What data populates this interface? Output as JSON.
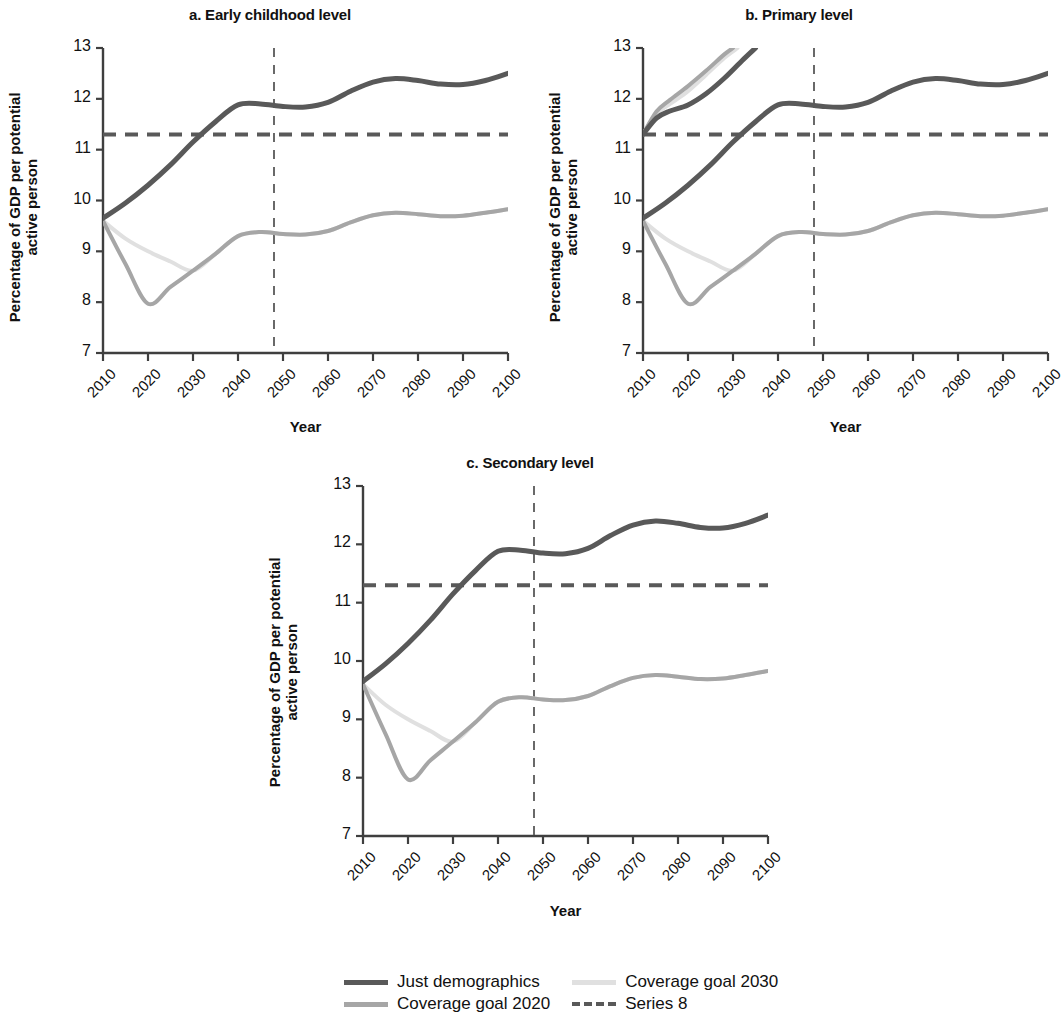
{
  "figure": {
    "background": "#ffffff",
    "panels": [
      {
        "id": "a",
        "title": "a. Early childhood level",
        "xlabel": "Year",
        "ylabel_line1": "Percentage of GDP per potential",
        "ylabel_line2": "active person"
      },
      {
        "id": "b",
        "title": "b. Primary level",
        "xlabel": "Year",
        "ylabel_line1": "Percentage of GDP per potential",
        "ylabel_line2": "active person"
      },
      {
        "id": "c",
        "title": "c. Secondary level",
        "xlabel": "Year",
        "ylabel_line1": "Percentage of GDP per potential",
        "ylabel_line2": "active person"
      }
    ]
  },
  "colors": {
    "just_demographics": "#595959",
    "coverage_goal_2020": "#a6a6a6",
    "coverage_goal_2030": "#e0e0e0",
    "series_8": "#595959",
    "axis": "#3f3f3f",
    "text": "#111111"
  },
  "legend": {
    "position": "bottom-center",
    "items": [
      {
        "label": "Just demographics",
        "color": "#595959",
        "style": "solid"
      },
      {
        "label": "Coverage goal 2030",
        "color": "#e0e0e0",
        "style": "solid"
      },
      {
        "label": "Coverage goal 2020",
        "color": "#a6a6a6",
        "style": "solid"
      },
      {
        "label": "Series 8",
        "color": "#595959",
        "style": "dashed"
      }
    ]
  },
  "chart_data": [
    {
      "type": "line",
      "panel": "a",
      "title": "a. Early childhood level",
      "xlabel": "Year",
      "ylabel": "Percentage of GDP per potential active person",
      "xlim": [
        2010,
        2100
      ],
      "ylim": [
        7,
        13
      ],
      "xticks": [
        2010,
        2020,
        2030,
        2040,
        2050,
        2060,
        2070,
        2080,
        2090,
        2100
      ],
      "yticks": [
        7,
        8,
        9,
        10,
        11,
        12,
        13
      ],
      "grid": false,
      "legend_position": "below figure",
      "annotations": [
        {
          "kind": "hline",
          "name": "Series 8",
          "y": 11.3,
          "style": "dashed",
          "color": "#595959"
        },
        {
          "kind": "vline",
          "name": "reference-year",
          "x": 2048,
          "style": "dashed",
          "color": "#595959"
        }
      ],
      "x": [
        2010,
        2015,
        2020,
        2025,
        2030,
        2035,
        2040,
        2045,
        2050,
        2055,
        2060,
        2065,
        2070,
        2075,
        2080,
        2085,
        2090,
        2095,
        2100
      ],
      "series": [
        {
          "name": "Just demographics",
          "color": "#595959",
          "values": [
            9.65,
            9.95,
            10.3,
            10.7,
            11.15,
            11.55,
            11.88,
            11.9,
            11.85,
            11.84,
            11.93,
            12.15,
            12.33,
            12.4,
            12.36,
            12.29,
            12.28,
            12.36,
            12.5
          ]
        },
        {
          "name": "Coverage goal 2020",
          "color": "#a6a6a6",
          "values": [
            9.6,
            8.75,
            7.97,
            8.3,
            8.62,
            8.95,
            9.3,
            9.38,
            9.34,
            9.33,
            9.4,
            9.57,
            9.71,
            9.76,
            9.73,
            9.69,
            9.7,
            9.76,
            9.83
          ]
        },
        {
          "name": "Coverage goal 2030",
          "color": "#e0e0e0",
          "values": [
            9.6,
            9.25,
            9.0,
            8.8,
            8.62,
            8.95,
            9.3,
            9.38,
            9.34,
            9.33,
            9.4,
            9.57,
            9.71,
            9.76,
            9.73,
            9.69,
            9.7,
            9.76,
            9.83
          ]
        }
      ]
    },
    {
      "type": "line",
      "panel": "b",
      "title": "b. Primary level",
      "xlabel": "Year",
      "ylabel": "Percentage of GDP per potential active person",
      "xlim": [
        2010,
        2100
      ],
      "ylim": [
        7,
        13
      ],
      "xticks": [
        2010,
        2020,
        2030,
        2040,
        2050,
        2060,
        2070,
        2080,
        2090,
        2100
      ],
      "yticks": [
        7,
        8,
        9,
        10,
        11,
        12,
        13
      ],
      "grid": false,
      "legend_position": "below figure",
      "annotations": [
        {
          "kind": "hline",
          "name": "Series 8",
          "y": 11.3,
          "style": "dashed",
          "color": "#595959"
        },
        {
          "kind": "vline",
          "name": "reference-year",
          "x": 2048,
          "style": "dashed",
          "color": "#595959"
        }
      ],
      "x": [
        2010,
        2015,
        2020,
        2025,
        2030,
        2035,
        2040,
        2045,
        2050,
        2055,
        2060,
        2065,
        2070,
        2075,
        2080,
        2085,
        2090,
        2095,
        2100
      ],
      "series": [
        {
          "name": "Just demographics",
          "color": "#595959",
          "values": [
            9.65,
            9.95,
            10.3,
            10.7,
            11.15,
            11.55,
            11.88,
            11.9,
            11.85,
            11.84,
            11.93,
            12.15,
            12.33,
            12.4,
            12.36,
            12.29,
            12.28,
            12.36,
            12.5
          ]
        },
        {
          "name": "Coverage goal 2020",
          "color": "#a6a6a6",
          "values": [
            9.6,
            8.75,
            7.97,
            8.3,
            8.62,
            8.95,
            9.3,
            9.38,
            9.34,
            9.33,
            9.4,
            9.57,
            9.71,
            9.76,
            9.73,
            9.69,
            9.7,
            9.76,
            9.83
          ]
        },
        {
          "name": "Coverage goal 2030",
          "color": "#e0e0e0",
          "values": [
            9.6,
            9.25,
            9.0,
            8.8,
            8.62,
            8.95,
            9.3,
            9.38,
            9.34,
            9.33,
            9.4,
            9.57,
            9.71,
            9.76,
            9.73,
            9.69,
            9.7,
            9.76,
            9.83
          ]
        },
        {
          "name": "Just demographics (upper branch)",
          "color": "#595959",
          "clipped_above": 13,
          "x": [
            2010,
            2013,
            2016,
            2020,
            2024,
            2028,
            2032,
            2035
          ],
          "values": [
            11.3,
            11.62,
            11.76,
            11.88,
            12.1,
            12.4,
            12.75,
            13.0
          ]
        },
        {
          "name": "Coverage goal 2020 (upper branch)",
          "color": "#a6a6a6",
          "clipped_above": 13,
          "x": [
            2010,
            2013,
            2016,
            2020,
            2024,
            2028,
            2030
          ],
          "values": [
            11.3,
            11.75,
            11.98,
            12.25,
            12.55,
            12.87,
            13.0
          ]
        },
        {
          "name": "Coverage goal 2030 (upper branch)",
          "color": "#e0e0e0",
          "clipped_above": 13,
          "x": [
            2010,
            2013,
            2016,
            2020,
            2024,
            2028,
            2031
          ],
          "values": [
            11.3,
            11.7,
            11.9,
            12.15,
            12.47,
            12.8,
            13.0
          ]
        }
      ]
    },
    {
      "type": "line",
      "panel": "c",
      "title": "c. Secondary level",
      "xlabel": "Year",
      "ylabel": "Percentage of GDP per potential active person",
      "xlim": [
        2010,
        2100
      ],
      "ylim": [
        7,
        13
      ],
      "xticks": [
        2010,
        2020,
        2030,
        2040,
        2050,
        2060,
        2070,
        2080,
        2090,
        2100
      ],
      "yticks": [
        7,
        8,
        9,
        10,
        11,
        12,
        13
      ],
      "grid": false,
      "legend_position": "below figure",
      "annotations": [
        {
          "kind": "hline",
          "name": "Series 8",
          "y": 11.3,
          "style": "dashed",
          "color": "#595959"
        },
        {
          "kind": "vline",
          "name": "reference-year",
          "x": 2048,
          "style": "dashed",
          "color": "#595959"
        }
      ],
      "x": [
        2010,
        2015,
        2020,
        2025,
        2030,
        2035,
        2040,
        2045,
        2050,
        2055,
        2060,
        2065,
        2070,
        2075,
        2080,
        2085,
        2090,
        2095,
        2100
      ],
      "series": [
        {
          "name": "Just demographics",
          "color": "#595959",
          "values": [
            9.65,
            9.95,
            10.3,
            10.7,
            11.15,
            11.55,
            11.88,
            11.9,
            11.85,
            11.84,
            11.93,
            12.15,
            12.33,
            12.4,
            12.36,
            12.29,
            12.28,
            12.36,
            12.5
          ]
        },
        {
          "name": "Coverage goal 2020",
          "color": "#a6a6a6",
          "values": [
            9.6,
            8.75,
            7.97,
            8.3,
            8.62,
            8.95,
            9.3,
            9.38,
            9.34,
            9.33,
            9.4,
            9.57,
            9.71,
            9.76,
            9.73,
            9.69,
            9.7,
            9.76,
            9.83
          ]
        },
        {
          "name": "Coverage goal 2030",
          "color": "#e0e0e0",
          "values": [
            9.6,
            9.25,
            9.0,
            8.8,
            8.62,
            8.95,
            9.3,
            9.38,
            9.34,
            9.33,
            9.4,
            9.57,
            9.71,
            9.76,
            9.73,
            9.69,
            9.7,
            9.76,
            9.83
          ]
        }
      ]
    }
  ]
}
